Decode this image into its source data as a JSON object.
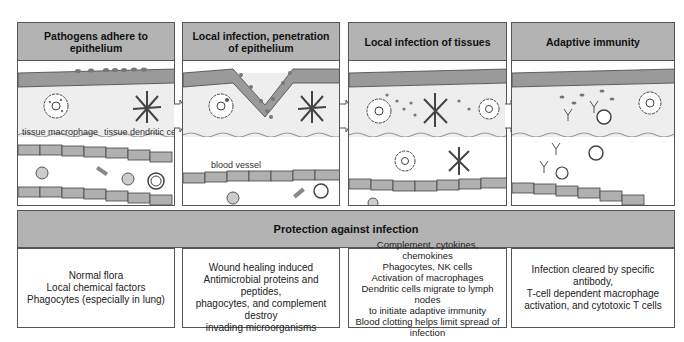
{
  "stages": [
    {
      "title": "Pathogens adhere to epithelium",
      "labels": {
        "macrophage": "tissue macrophage",
        "dendritic": "tissue dendritic cell"
      }
    },
    {
      "title": "Local infection, penetration of epithelium",
      "labels": {
        "vessel": "blood vessel"
      }
    },
    {
      "title": "Local infection of tissues"
    },
    {
      "title": "Adaptive immunity"
    }
  ],
  "banner": {
    "title": "Protection against infection"
  },
  "protection": [
    {
      "lines": [
        "Normal flora",
        "Local chemical factors",
        "Phagocytes (especially in lung)"
      ]
    },
    {
      "lines": [
        "Wound healing induced",
        "Antimicrobial proteins and peptides,",
        "phagocytes, and complement destroy",
        "invading microorganisms"
      ]
    },
    {
      "lines": [
        "Complement, cytokines, chemokines",
        "Phagocytes, NK cells",
        "Activation of macrophages",
        "Dendritic cells migrate to lymph nodes",
        "to initiate adaptive immunity",
        "Blood clotting helps limit spread of",
        "infection"
      ]
    },
    {
      "lines": [
        "Infection cleared by specific antibody,",
        "T-cell dependent macrophage",
        "activation, and cytotoxic T cells"
      ]
    }
  ],
  "colors": {
    "header": "#b3b3b3",
    "epithelium": "#9a9a9a",
    "tissue": "#eeeeee",
    "cell": "#b0b0b0",
    "outline": "#555555"
  }
}
